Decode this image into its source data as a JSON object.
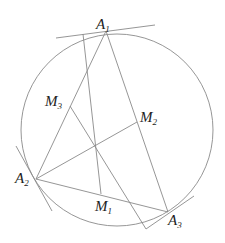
{
  "diagram": {
    "type": "geometry",
    "stroke_color": "#8a8a8a",
    "label_color": "#222222",
    "circle": {
      "cx": 117,
      "cy": 130,
      "r": 96
    },
    "points": {
      "A1": {
        "x": 106,
        "y": 31,
        "label": "A",
        "sub": "1"
      },
      "A2": {
        "x": 36,
        "y": 179,
        "label": "A",
        "sub": "2"
      },
      "A3": {
        "x": 168,
        "y": 212,
        "label": "A",
        "sub": "3"
      },
      "M1": {
        "x": 101,
        "y": 194,
        "label": "M",
        "sub": "1"
      },
      "M2": {
        "x": 137,
        "y": 122,
        "label": "M",
        "sub": "2"
      },
      "M3": {
        "x": 70,
        "y": 106,
        "label": "M",
        "sub": "3"
      }
    },
    "labels": {
      "A1": {
        "main": "A",
        "sub": "1"
      },
      "A2": {
        "main": "A",
        "sub": "2"
      },
      "A3": {
        "main": "A",
        "sub": "3"
      },
      "M1": {
        "main": "M",
        "sub": "1"
      },
      "M2": {
        "main": "M",
        "sub": "2"
      },
      "M3": {
        "main": "M",
        "sub": "3"
      }
    }
  }
}
